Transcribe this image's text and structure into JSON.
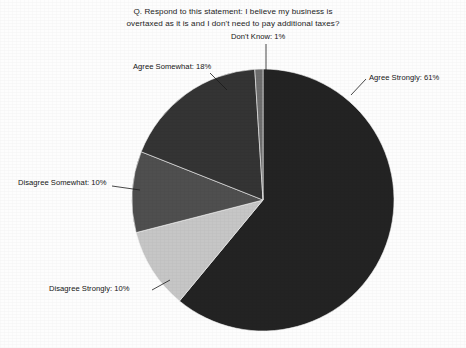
{
  "title": {
    "line1": "Q. Respond to this statement: I believe my business is",
    "line2": "overtaxed as it is and I don't need to pay additional taxes?"
  },
  "labels": {
    "dont_know": "Don't Know: 1%",
    "agree_somewhat": "Agree Somewhat: 18%",
    "agree_strongly": "Agree Strongly: 61%",
    "disagree_somewhat": "Disagree Somewhat: 10%",
    "disagree_strongly": "Disagree Strongly: 10%"
  },
  "chart_data": {
    "type": "pie",
    "title": "Q. Respond to this statement: I believe my business is overtaxed as it is and I don't need to pay additional taxes?",
    "xlabel": "",
    "ylabel": "",
    "legend_position": "none",
    "grid": false,
    "value_unit": "%",
    "start_angle_deg": 0,
    "direction": "clockwise",
    "categories": [
      "Agree Strongly",
      "Disagree Strongly",
      "Disagree Somewhat",
      "Agree Somewhat",
      "Don't Know"
    ],
    "values": [
      61,
      10,
      10,
      18,
      1
    ],
    "labels": [
      "Agree Strongly: 61%",
      "Disagree Strongly: 10%",
      "Disagree Somewhat: 10%",
      "Agree Somewhat: 18%",
      "Don't Know: 1%"
    ],
    "colors": [
      "#232323",
      "#c6c6c6",
      "#4f4f4f",
      "#343434",
      "#6e6e6e"
    ],
    "slices": [
      {
        "name": "Agree Strongly",
        "value": 61,
        "color": "#232323",
        "start_deg": 0,
        "end_deg": 219.6
      },
      {
        "name": "Disagree Strongly",
        "value": 10,
        "color": "#c6c6c6",
        "start_deg": 219.6,
        "end_deg": 255.6
      },
      {
        "name": "Disagree Somewhat",
        "value": 10,
        "color": "#4f4f4f",
        "start_deg": 255.6,
        "end_deg": 291.6
      },
      {
        "name": "Agree Somewhat",
        "value": 18,
        "color": "#343434",
        "start_deg": 291.6,
        "end_deg": 356.4
      },
      {
        "name": "Don't Know",
        "value": 1,
        "color": "#6e6e6e",
        "start_deg": 356.4,
        "end_deg": 360
      }
    ]
  },
  "geometry": {
    "center_x": 263,
    "center_y": 200,
    "radius": 131
  }
}
